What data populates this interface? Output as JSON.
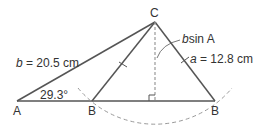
{
  "diagram": {
    "vertices": {
      "A": "A",
      "C": "C",
      "B1": "B",
      "B2": "B"
    },
    "side_b": {
      "var": "b",
      "text": " = 20.5 cm"
    },
    "side_a": {
      "var": "a",
      "text": " = 12.8 cm"
    },
    "height": {
      "var": "b",
      "text": "sin A"
    },
    "angle_A": "29.3°",
    "colors": {
      "line": "#555555",
      "dashed": "#999999",
      "text": "#333333"
    }
  }
}
